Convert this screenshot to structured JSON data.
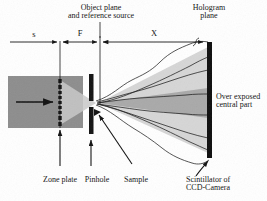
{
  "figure": {
    "kind": "optical-setup-diagram",
    "title_absent": true
  },
  "labels": {
    "object_plane": "Object plane\nand reference source",
    "hologram_plane": "Hologram\nplane",
    "over_exposed": "Over exposed\ncentral part",
    "zone_plate": "Zone plate",
    "pinhole": "Pinhole",
    "sample": "Sample",
    "scintillator": "Scintillator of\nCCD-Camera"
  },
  "dimensions": [
    {
      "name": "s",
      "label": "s",
      "from_x": 10,
      "to_x": 60,
      "text_x": 33
    },
    {
      "name": "F",
      "label": "F",
      "from_x": 60,
      "to_x": 100,
      "text_x": 80
    },
    {
      "name": "X",
      "label": "X",
      "from_x": 100,
      "to_x": 208,
      "text_x": 154
    }
  ],
  "components": {
    "incoming_beam": {
      "name": "incoming-beam-block",
      "x": 8,
      "y": 76,
      "w": 75,
      "h": 52,
      "color": "#8d8d8d"
    },
    "beam_arrow": {
      "name": "beam-direction-arrow",
      "x1": 16,
      "y1": 102,
      "x2": 55,
      "y2": 102
    },
    "zone_plate": {
      "name": "zone-plate",
      "x": 60,
      "y_top": 78,
      "y_bottom": 126,
      "segments": 9,
      "color": "#111111"
    },
    "pinhole": {
      "name": "pinhole-aperture",
      "x": 91,
      "y_top": 74,
      "y_bottom": 132,
      "gap_top": 100,
      "gap_bottom": 106,
      "color": "#111111"
    },
    "sample": {
      "name": "sample-marker",
      "x": 97,
      "y": 112
    },
    "hologram_plane_bar": {
      "name": "hologram-plane-bar",
      "x": 208,
      "y_top": 42,
      "y_bottom": 158,
      "width": 5,
      "color": "#0d0d0d"
    },
    "light_cone": {
      "name": "diverging-light-cone",
      "apex_x": 98,
      "apex_y": 103,
      "end_x": 208,
      "top_y": 48,
      "bottom_y": 152,
      "color": "#d6d6d6"
    },
    "overexposed_band": {
      "name": "overexposed-central-band",
      "apex_x": 98,
      "end_x": 208,
      "top_y": 88,
      "bottom_y": 118,
      "color": "#a9a9a9"
    },
    "reference_line": {
      "name": "object-plane-reference-line",
      "x": 100,
      "y_top": 36,
      "y_bottom": 103
    },
    "zone_plate_guide": {
      "name": "zone-plate-guide-line",
      "x": 60,
      "y_top": 41,
      "y_bottom": 128
    }
  },
  "colors": {
    "beam_block": "#8d8d8d",
    "cone": "#d6d6d6",
    "overexposed": "#a9a9a9",
    "bar": "#0d0d0d",
    "ink": "#111111",
    "background": "#ffffff"
  },
  "callouts": [
    {
      "name": "zone-plate-callout",
      "label_ref": "zone_plate",
      "arrow_from_x": 60,
      "arrow_from_y": 164,
      "arrow_to_x": 60,
      "arrow_to_y": 126
    },
    {
      "name": "pinhole-callout",
      "label_ref": "pinhole",
      "arrow_from_x": 91,
      "arrow_from_y": 164,
      "arrow_to_x": 91,
      "arrow_to_y": 138
    },
    {
      "name": "sample-callout",
      "label_ref": "sample",
      "arrow_from_x": 131,
      "arrow_from_y": 164,
      "arrow_to_x": 98,
      "arrow_to_y": 113
    },
    {
      "name": "scintillator-callout",
      "label_ref": "scintillator",
      "arrow_from_x": 200,
      "arrow_from_y": 172,
      "arrow_to_x": 210,
      "arrow_to_y": 160
    }
  ]
}
